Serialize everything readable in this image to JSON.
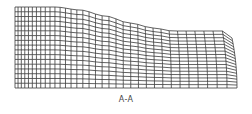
{
  "figure": {
    "caption": "A-A",
    "line_color": "#3a3a3a",
    "mesh": {
      "left": 15,
      "right": 237,
      "bottom": 88,
      "columns": 34,
      "rows": 17,
      "top_profile": [
        [
          15,
          7
        ],
        [
          55,
          7
        ],
        [
          80,
          10
        ],
        [
          105,
          16
        ],
        [
          130,
          23
        ],
        [
          155,
          28
        ],
        [
          175,
          31
        ],
        [
          228,
          31
        ],
        [
          234,
          33
        ],
        [
          237,
          38
        ]
      ]
    }
  }
}
